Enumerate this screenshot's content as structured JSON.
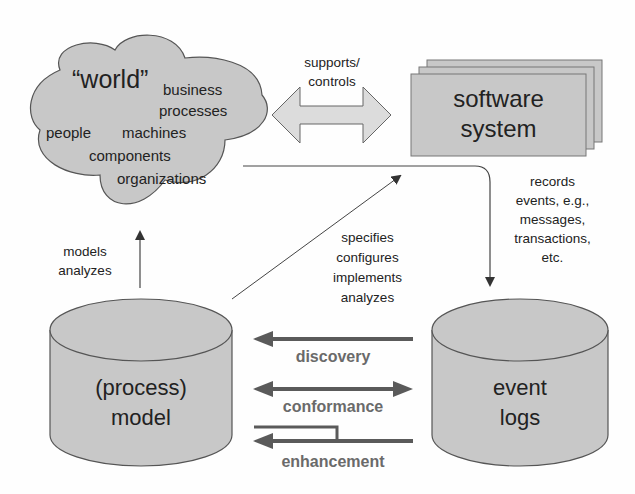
{
  "world": {
    "title": "“world”",
    "items": [
      "business",
      "processes",
      "people",
      "machines",
      "components",
      "organizations"
    ]
  },
  "supports_label": [
    "supports/",
    "controls"
  ],
  "software": {
    "line1": "software",
    "line2": "system"
  },
  "records_label": [
    "records",
    "events, e.g.,",
    "messages,",
    "transactions,",
    "etc."
  ],
  "models_label": [
    "models",
    "analyzes"
  ],
  "specifies_label": [
    "specifies",
    "configures",
    "implements",
    "analyzes"
  ],
  "process_model": {
    "line1": "(process)",
    "line2": "model"
  },
  "event_logs": {
    "line1": "event",
    "line2": "logs"
  },
  "relations": {
    "discovery": "discovery",
    "conformance": "conformance",
    "enhancement": "enhancement"
  },
  "colors": {
    "fill": "#c8c8c8",
    "stroke": "#555555",
    "arrow": "#5a5a5a",
    "light_arrow": "#dcdcdc"
  }
}
